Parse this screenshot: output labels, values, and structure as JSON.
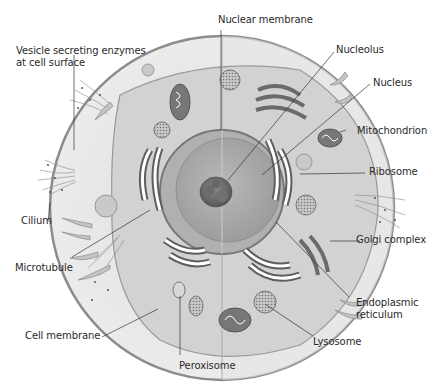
{
  "diagram": {
    "labels": {
      "nuclear_membrane": "Nuclear membrane",
      "vesicle_line1": "Vesicle secreting enzymes",
      "vesicle_line2": "at cell surface",
      "nucleolus": "Nucleolus",
      "nucleus": "Nucleus",
      "mitochondrion": "Mitochondrion",
      "ribosome": "Ribosome",
      "cilium": "Cilium",
      "golgi_complex": "Golgi complex",
      "microtubule": "Microtubule",
      "endoplasmic_line1": "Endoplasmic",
      "endoplasmic_line2": "reticulum",
      "lysosome": "Lysosome",
      "cell_membrane": "Cell membrane",
      "peroxisome": "Peroxisome"
    },
    "colors": {
      "background": "#ffffff",
      "cytoplasm_light": "#e9e9e9",
      "cytoplasm_dark": "#cfcfcf",
      "membrane": "#8c8c8c",
      "organelle_dark": "#5a5a5a",
      "leader_line": "#333333"
    }
  }
}
